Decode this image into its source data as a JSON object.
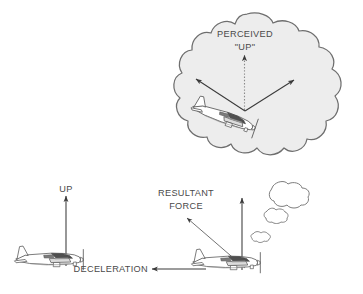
{
  "figure": {
    "background_color": "#ffffff",
    "line_color": "#4a4a4a",
    "text_color": "#4a4a4a",
    "cloud_fill": "#ededed",
    "cloud_stroke": "#6e6e6e",
    "small_cloud_fill": "#ffffff",
    "aircraft_fill": "#ffffff",
    "aircraft_stroke": "#555555"
  },
  "labels": {
    "perceived": "PERCEIVED",
    "perceived_up": "\"UP\"",
    "up": "UP",
    "resultant_line1": "RESULTANT",
    "resultant_line2": "FORCE",
    "deceleration": "DECELERATION"
  },
  "scenes": {
    "perceived_scene": {
      "name": "pilot-perception-thought-cloud",
      "aircraft_attitude": "nose-down pitched, tilted",
      "arrows": [
        {
          "name": "perceived-up-arrow",
          "style": "dotted",
          "direction": "up"
        },
        {
          "name": "left-sensed-arrow",
          "style": "solid",
          "direction": "up-left"
        },
        {
          "name": "right-sensed-arrow",
          "style": "solid",
          "direction": "up-right"
        }
      ]
    },
    "level_scene": {
      "name": "level-flight-aircraft",
      "aircraft_attitude": "level",
      "arrows": [
        {
          "name": "up-arrow",
          "style": "solid",
          "direction": "up"
        }
      ]
    },
    "decel_scene": {
      "name": "decelerating-aircraft",
      "aircraft_attitude": "level",
      "arrows": [
        {
          "name": "vertical-lift-arrow",
          "style": "solid",
          "direction": "up"
        },
        {
          "name": "resultant-force-arrow",
          "style": "solid",
          "direction": "up-left"
        },
        {
          "name": "deceleration-arrow",
          "style": "solid",
          "direction": "left"
        }
      ],
      "clouds": [
        "cloud-large",
        "cloud-medium",
        "cloud-small"
      ]
    }
  }
}
